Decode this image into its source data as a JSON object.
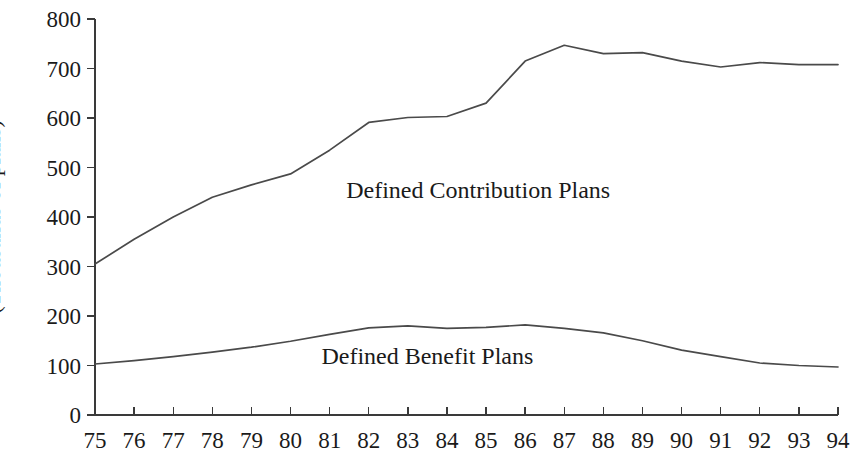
{
  "chart_data": {
    "type": "line",
    "title": "",
    "xlabel": "",
    "ylabel": "(Thousands of plans)",
    "xlim": [
      75,
      94
    ],
    "ylim": [
      0,
      800
    ],
    "ytick_values": [
      0,
      100,
      200,
      300,
      400,
      500,
      600,
      700,
      800
    ],
    "ytick_labels": [
      "0",
      "100",
      "200",
      "300",
      "400",
      "500",
      "600",
      "700",
      "800"
    ],
    "x": [
      75,
      76,
      77,
      78,
      79,
      80,
      81,
      82,
      83,
      84,
      85,
      86,
      87,
      88,
      89,
      90,
      91,
      92,
      93,
      94
    ],
    "xtick_labels": [
      "75",
      "76",
      "77",
      "78",
      "79",
      "80",
      "81",
      "82",
      "83",
      "84",
      "85",
      "86",
      "87",
      "88",
      "89",
      "90",
      "91",
      "92",
      "93",
      "94"
    ],
    "grid": false,
    "legend_position": "inline-annotation",
    "series": [
      {
        "name": "Defined Contribution Plans",
        "color": "#4a4a4a",
        "values": [
          305,
          355,
          400,
          440,
          465,
          487,
          535,
          591,
          601,
          603,
          630,
          715,
          747,
          730,
          732,
          715,
          703,
          712,
          708,
          708
        ],
        "label_x": 84.8,
        "label_y": 455
      },
      {
        "name": "Defined Benefit Plans",
        "color": "#4a4a4a",
        "values": [
          103,
          110,
          118,
          127,
          137,
          149,
          163,
          176,
          180,
          175,
          177,
          182,
          175,
          166,
          150,
          131,
          118,
          105,
          100,
          97
        ],
        "label_x": 83.5,
        "label_y": 120
      }
    ]
  },
  "geometry": {
    "plot_left": 95,
    "plot_right": 838,
    "plot_top": 19,
    "plot_bottom": 415,
    "y_tick_len": 8,
    "x_tick_len": 8
  }
}
